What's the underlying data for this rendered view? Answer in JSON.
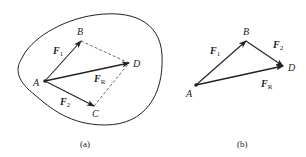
{
  "figure": {
    "panels": [
      {
        "id": "a",
        "caption": "(a)",
        "points": {
          "A": {
            "label": "A",
            "x": 45,
            "y": 81
          },
          "B": {
            "label": "B",
            "x": 81,
            "y": 41
          },
          "C": {
            "label": "C",
            "x": 94,
            "y": 106
          },
          "D": {
            "label": "D",
            "x": 129,
            "y": 63
          }
        },
        "vectors": [
          {
            "name": "F",
            "sub": "1",
            "from": "A",
            "to": "B"
          },
          {
            "name": "F",
            "sub": "2",
            "from": "A",
            "to": "C"
          },
          {
            "name": "F",
            "sub": "R",
            "from": "A",
            "to": "D"
          }
        ],
        "dashed_lines": [
          [
            "B",
            "D"
          ],
          [
            "C",
            "D"
          ]
        ],
        "has_body_outline": true
      },
      {
        "id": "b",
        "caption": "(b)",
        "points": {
          "A": {
            "label": "A",
            "x": 196,
            "y": 85
          },
          "B": {
            "label": "B",
            "x": 246,
            "y": 41
          },
          "D": {
            "label": "D",
            "x": 283,
            "y": 66
          }
        },
        "vectors": [
          {
            "name": "F",
            "sub": "1",
            "from": "A",
            "to": "B"
          },
          {
            "name": "F",
            "sub": "2",
            "from": "B",
            "to": "D"
          },
          {
            "name": "F",
            "sub": "R",
            "from": "A",
            "to": "D"
          }
        ],
        "has_body_outline": false
      }
    ],
    "colors": {
      "stroke": "#222222",
      "background": "#ffffff"
    }
  }
}
